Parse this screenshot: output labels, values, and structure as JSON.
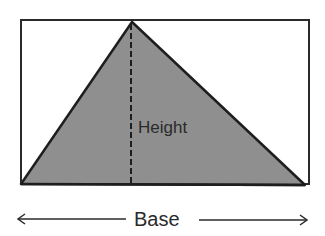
{
  "diagram": {
    "height_label": "Height",
    "base_label": "Base",
    "colors": {
      "fill": "#8f8f8f",
      "stroke": "#1e1e1e",
      "background": "#ffffff"
    }
  }
}
